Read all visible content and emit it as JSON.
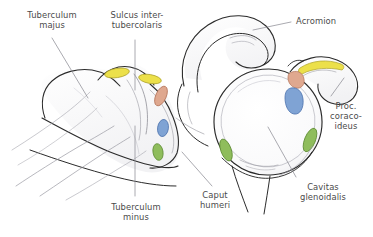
{
  "figure": {
    "kind": "anatomical-illustration",
    "background_color": "#ffffff",
    "outline_color": "#2b2b2b",
    "fine_line_color": "#7d7d86",
    "leader_color": "#8d8d95",
    "text_color": "#4a4a4a"
  },
  "labels": {
    "tuberculum_majus": "Tuberculum\nmajus",
    "sulcus_intertubercolaris": "Sulcus inter-\ntubercolaris",
    "acromion": "Acromion",
    "proc_coracoideus": "Proc.\ncoraco-\nideus",
    "cavitas_glenoidalis": "Cavitas\nglenoidalis",
    "caput_humeri": "Caput\nhumeri",
    "tuberculum_minus": "Tuberculum\nminus"
  },
  "markers": {
    "yellow": "#ece04a",
    "yellow_stroke": "#b9ae2c",
    "salmon": "#dba branches",
    "salmon_fill": "#dfa88f",
    "salmon_stroke": "#b9765c",
    "blue_fill": "#7fa3d4",
    "blue_stroke": "#4d72ad",
    "green_fill": "#8fbd5c",
    "green_stroke": "#5f8c35"
  },
  "marker_list": [
    {
      "name": "supraspinatus-facet-yellow",
      "color": "#ece04a"
    },
    {
      "name": "infraspinatus-facet-yellow",
      "color": "#ece04a"
    },
    {
      "name": "teres-minor-facet-salmon",
      "color": "#dfa88f"
    },
    {
      "name": "subscapularis-facet-blue",
      "color": "#7fa3d4"
    },
    {
      "name": "lower-facet-green",
      "color": "#8fbd5c"
    },
    {
      "name": "glenoid-superior-yellow",
      "color": "#ece04a"
    },
    {
      "name": "glenoid-salmon",
      "color": "#dfa88f"
    },
    {
      "name": "glenoid-blue",
      "color": "#7fa3d4"
    },
    {
      "name": "glenoid-anterior-green",
      "color": "#8fbd5c"
    },
    {
      "name": "glenoid-posterior-green",
      "color": "#8fbd5c"
    }
  ]
}
